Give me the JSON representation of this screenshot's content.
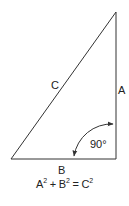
{
  "diagram": {
    "type": "right-triangle",
    "colors": {
      "stroke": "#333333",
      "text": "#222222",
      "background": "#ffffff"
    },
    "vertices": {
      "top": [
        116,
        12
      ],
      "bottom_left": [
        11,
        159
      ],
      "bottom_right": [
        116,
        159
      ]
    },
    "labels": {
      "hypotenuse": "C",
      "vertical_side": "A",
      "horizontal_side": "B",
      "angle": "90°"
    },
    "formula": {
      "a": "A",
      "b": "B",
      "c": "C",
      "exp": "2",
      "plus": " + ",
      "equals": " = "
    }
  }
}
